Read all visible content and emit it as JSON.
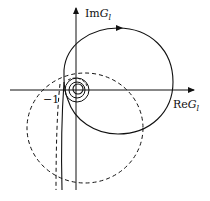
{
  "diagram": {
    "type": "nyquist-plot",
    "axes": {
      "x_label": "Re",
      "x_var": "G",
      "x_sub": "l",
      "y_label": "Im",
      "y_var": "G",
      "y_sub": "l"
    },
    "point_label": "−1",
    "curves": [
      {
        "name": "solid-locus",
        "style": "solid",
        "shape": "large circle with direction arrow at top, spirals into origin"
      },
      {
        "name": "dashed-locus",
        "style": "dashed",
        "shape": "large circle below-left, encircling −1"
      },
      {
        "name": "origin-spirals",
        "style": "solid",
        "shape": "small concentric loops near origin"
      },
      {
        "name": "vertical-asymptotes",
        "style": "solid and dashed",
        "shape": "near-vertical lines descending left of Im axis"
      }
    ],
    "colors": {
      "line": "#111111",
      "background": "#ffffff"
    }
  }
}
